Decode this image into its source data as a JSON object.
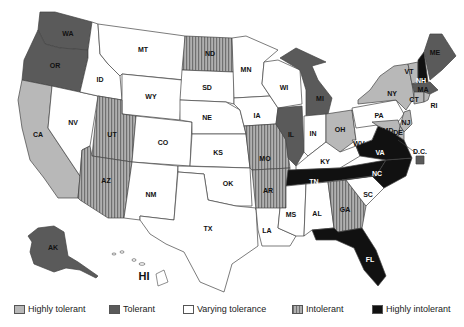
{
  "map": {
    "title": "",
    "categories": {
      "highly_tolerant": {
        "label": "Highly tolerant",
        "color": "#b8b8b8",
        "pattern": "solid"
      },
      "tolerant": {
        "label": "Tolerant",
        "color": "#5a5a5a",
        "pattern": "solid"
      },
      "varying": {
        "label": "Varying tolerance",
        "color": "#ffffff",
        "pattern": "solid"
      },
      "intolerant": {
        "label": "Intolerant",
        "color": "#9a9a9a",
        "pattern": "vertical-stripes"
      },
      "highly_intolerant": {
        "label": "Highly intolerant",
        "color": "#111111",
        "pattern": "solid"
      }
    },
    "states": {
      "WA": "tolerant",
      "OR": "tolerant",
      "CA": "highly_tolerant",
      "NV": "varying",
      "ID": "varying",
      "MT": "varying",
      "WY": "varying",
      "UT": "intolerant",
      "AZ": "intolerant",
      "CO": "varying",
      "NM": "varying",
      "ND": "intolerant",
      "SD": "varying",
      "NE": "varying",
      "KS": "varying",
      "OK": "varying",
      "TX": "varying",
      "MN": "varying",
      "IA": "varying",
      "MO": "intolerant",
      "AR": "intolerant",
      "LA": "varying",
      "WI": "varying",
      "IL": "tolerant",
      "MI": "tolerant",
      "IN": "varying",
      "OH": "highly_tolerant",
      "KY": "varying",
      "TN": "highly_intolerant",
      "MS": "varying",
      "AL": "varying",
      "GA": "intolerant",
      "FL": "highly_intolerant",
      "SC": "varying",
      "NC": "highly_intolerant",
      "VA": "highly_intolerant",
      "WV": "varying",
      "PA": "varying",
      "NY": "highly_tolerant",
      "VT": "highly_tolerant",
      "NH": "highly_intolerant",
      "ME": "tolerant",
      "MA": "tolerant",
      "RI": "highly_tolerant",
      "CT": "highly_tolerant",
      "NJ": "highly_tolerant",
      "DE": "highly_tolerant",
      "MD": "highly_tolerant",
      "DC": "tolerant",
      "AK": "tolerant",
      "HI": "varying"
    },
    "labels": {
      "WA": "WA",
      "OR": "OR",
      "CA": "CA",
      "NV": "NV",
      "ID": "ID",
      "MT": "MT",
      "WY": "WY",
      "UT": "UT",
      "AZ": "AZ",
      "CO": "CO",
      "NM": "NM",
      "ND": "ND",
      "SD": "SD",
      "NE": "NE",
      "KS": "KS",
      "OK": "OK",
      "TX": "TX",
      "MN": "MN",
      "IA": "IA",
      "MO": "MO",
      "AR": "AR",
      "LA": "LA",
      "WI": "WI",
      "IL": "IL",
      "MI": "MI",
      "IN": "IN",
      "OH": "OH",
      "KY": "KY",
      "TN": "TN",
      "MS": "MS",
      "AL": "AL",
      "GA": "GA",
      "FL": "FL",
      "SC": "SC",
      "NC": "NC",
      "VA": "VA",
      "WV": "WV",
      "PA": "PA",
      "NY": "NY",
      "VT": "VT",
      "NH": "NH",
      "ME": "ME",
      "MA": "MA",
      "RI": "RI",
      "CT": "CT",
      "NJ": "NJ",
      "DE": "DE",
      "MD": "MD",
      "DC": "D.C.",
      "AK": "AK",
      "HI": "HI"
    }
  },
  "legend": {
    "items": [
      {
        "label": "Highly tolerant",
        "color": "#b8b8b8"
      },
      {
        "label": "Tolerant",
        "color": "#5a5a5a"
      },
      {
        "label": "Varying tolerance",
        "color": "#ffffff"
      },
      {
        "label": "Intolerant",
        "color": "#9a9a9a"
      },
      {
        "label": "Highly intolerant",
        "color": "#111111"
      }
    ]
  }
}
